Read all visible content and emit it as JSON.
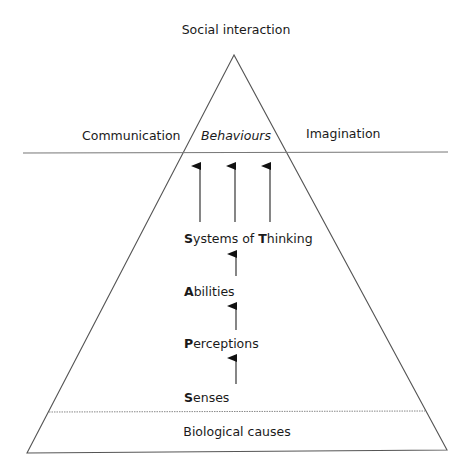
{
  "diagram": {
    "top_label": "Social interaction",
    "left_label": "Communication",
    "center_label": "Behaviours",
    "right_label": "Imagination",
    "levels": [
      {
        "initial": "S",
        "rest": "ystems of ",
        "initial2": "T",
        "rest2": "hinking"
      },
      {
        "initial": "A",
        "rest": "bilities"
      },
      {
        "initial": "P",
        "rest": "erceptions"
      },
      {
        "initial": "S",
        "rest": "enses"
      }
    ],
    "base_label": "Biological causes",
    "colors": {
      "line": "#555555",
      "text": "#1a1a1a",
      "background": "#ffffff"
    }
  }
}
